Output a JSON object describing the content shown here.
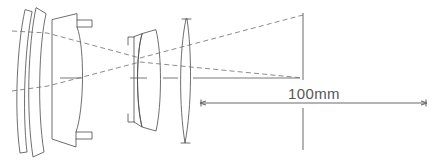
{
  "diagram": {
    "type": "optical-ray-diagram",
    "background_color": "#ffffff",
    "stroke_color": "#4a4a4a",
    "ray_color": "#6e6e6e",
    "text_color": "#575757"
  },
  "scale": {
    "label": "100mm",
    "value": 100,
    "unit": "mm",
    "bar_start_x": 200,
    "bar_end_x": 427,
    "bar_y": 103,
    "label_x": 288,
    "label_y": 98
  },
  "image_plane": {
    "name": "image-plane",
    "x": 303,
    "y_top": 13,
    "y_bottom": 150
  },
  "optical_axis": {
    "name": "optical-axis",
    "y": 78,
    "x_start": 12,
    "x_end": 303
  },
  "elements": [
    {
      "id": 1,
      "name": "front-meniscus-outer",
      "kind": "meniscus"
    },
    {
      "id": 2,
      "name": "front-meniscus-inner",
      "kind": "meniscus"
    },
    {
      "id": 3,
      "name": "thick-negative-element",
      "kind": "plano-concave"
    },
    {
      "id": 4,
      "name": "doublet-front-meniscus",
      "kind": "meniscus"
    },
    {
      "id": 5,
      "name": "doublet-rear-positive",
      "kind": "positive-meniscus"
    },
    {
      "id": 6,
      "name": "rear-biconvex-element",
      "kind": "biconvex"
    }
  ],
  "rays": [
    {
      "id": "ray-upper",
      "name": "upper-field-ray",
      "style": "dashed"
    },
    {
      "id": "ray-lower",
      "name": "lower-field-ray",
      "style": "dashed"
    }
  ]
}
